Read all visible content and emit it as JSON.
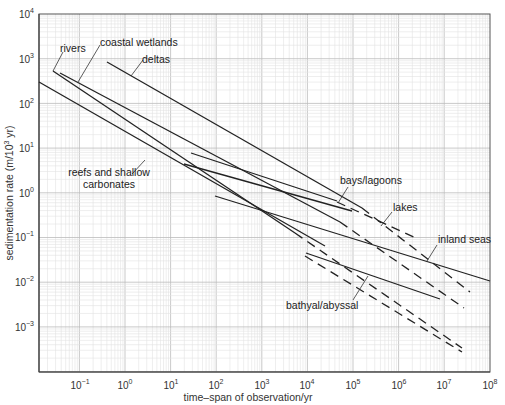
{
  "chart_data": {
    "type": "line",
    "title": "",
    "xlabel": "time–span of observation/yr",
    "ylabel": "sedimentation rate (m/10^3 yr)",
    "xscale": "log",
    "yscale": "log",
    "xlim": [
      0.012,
      100000000
    ],
    "ylim": [
      0.0001,
      10000
    ],
    "grid": true,
    "x_ticks": [
      "10^-1",
      "10^0",
      "10^1",
      "10^2",
      "10^3",
      "10^4",
      "10^5",
      "10^6",
      "10^7",
      "10^8"
    ],
    "y_ticks": [
      "10^4",
      "10^3",
      "10^2",
      "10^1",
      "10^0",
      "10^-1",
      "10^-2",
      "10^-3"
    ],
    "series": [
      {
        "name": "rivers",
        "solid": [
          [
            0.025,
            400
          ],
          [
            3000,
            0.3
          ]
        ],
        "dashed": [
          [
            3000,
            0.3
          ],
          [
            20000000,
            0.003
          ]
        ]
      },
      {
        "name": "coastal wetlands",
        "solid": [
          [
            0.035,
            350
          ],
          [
            30000,
            0.5
          ]
        ],
        "dashed": [
          [
            30000,
            0.5
          ],
          [
            30000000,
            0.006
          ]
        ]
      },
      {
        "name": "deltas",
        "solid": [
          [
            0.3,
            700
          ],
          [
            40000,
            0.7
          ]
        ],
        "dashed": [
          [
            40000,
            0.7
          ],
          [
            20000000,
            0.015
          ]
        ]
      },
      {
        "name": "reefs and shallow carbonates",
        "solid": [
          [
            0.012,
            250
          ],
          [
            5000,
            0.06
          ]
        ],
        "dashed": []
      },
      {
        "name": "bays/lagoons",
        "solid": [
          [
            50,
            4
          ],
          [
            50000,
            0.5
          ]
        ],
        "dashed": []
      },
      {
        "name": "lakes",
        "solid": [
          [
            70,
            7
          ],
          [
            20000,
            0.2
          ]
        ],
        "dashed": [
          [
            20000,
            0.2
          ],
          [
            3000000,
            0.06
          ]
        ]
      },
      {
        "name": "inland seas",
        "solid": [
          [
            60,
            0.9
          ],
          [
            100000000,
            0.01
          ]
        ],
        "dashed": []
      },
      {
        "name": "bathyal/abyssal",
        "solid": [
          [
            8000,
            0.045
          ],
          [
            8000000,
            0.004
          ]
        ],
        "dashed": [
          [
            10000,
            0.03
          ],
          [
            20000000,
            0.0003
          ]
        ]
      }
    ],
    "annotations": [
      "rivers",
      "coastal wetlands",
      "deltas",
      "reefs and shallow carbonates",
      "bays/lagoons",
      "lakes",
      "inland seas",
      "bathyal/abyssal"
    ]
  },
  "axes": {
    "xlabel": "time–span of observation/yr",
    "ylabel_pre": "sedimentation rate (m/10",
    "ylabel_sup": "3",
    "ylabel_post": " yr)",
    "x_ticks": [
      {
        "base": "10",
        "exp": "−1"
      },
      {
        "base": "10",
        "exp": "0"
      },
      {
        "base": "10",
        "exp": "1"
      },
      {
        "base": "10",
        "exp": "2"
      },
      {
        "base": "10",
        "exp": "3"
      },
      {
        "base": "10",
        "exp": "4"
      },
      {
        "base": "10",
        "exp": "5"
      },
      {
        "base": "10",
        "exp": "6"
      },
      {
        "base": "10",
        "exp": "7"
      },
      {
        "base": "10",
        "exp": "8"
      }
    ],
    "y_ticks": [
      {
        "base": "10",
        "exp": "4"
      },
      {
        "base": "10",
        "exp": "3"
      },
      {
        "base": "10",
        "exp": "2"
      },
      {
        "base": "10",
        "exp": "1"
      },
      {
        "base": "10",
        "exp": "0"
      },
      {
        "base": "10",
        "exp": "−1"
      },
      {
        "base": "10",
        "exp": "−2"
      },
      {
        "base": "10",
        "exp": "−3"
      }
    ]
  },
  "labels": {
    "rivers": "rivers",
    "coastal_wetlands": "coastal wetlands",
    "deltas": "deltas",
    "reefs_1": "reefs and shallow",
    "reefs_2": "carbonates",
    "bays": "bays/lagoons",
    "lakes": "lakes",
    "inland_seas": "inland seas",
    "bathyal": "bathyal/abyssal"
  }
}
